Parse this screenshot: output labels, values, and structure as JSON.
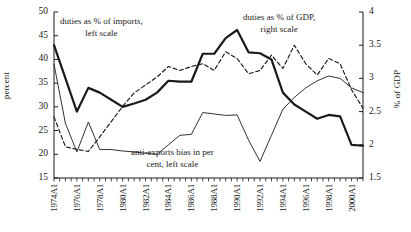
{
  "chart_data": {
    "type": "line",
    "title": "",
    "xlabel": "",
    "ylabel": "percent",
    "y2label": "% of GDP",
    "ylim": [
      15,
      50
    ],
    "y2lim": [
      1.5,
      4.0
    ],
    "grid": false,
    "legend": "inline-annotations",
    "x_tick_labels": [
      "1974A1",
      "1976A1",
      "1978A1",
      "1980A1",
      "1982A1",
      "1984A1",
      "1986A1",
      "1988A1",
      "1990A1",
      "1992A1",
      "1994A1",
      "1996A1",
      "1998A1",
      "2000A1"
    ],
    "y_tick_labels": [
      "15",
      "20",
      "25",
      "30",
      "35",
      "40",
      "45",
      "50"
    ],
    "y2_tick_labels": [
      "1.5",
      "2",
      "2.5",
      "3",
      "3.5",
      "4"
    ],
    "x": [
      1974,
      1975,
      1976,
      1977,
      1978,
      1979,
      1980,
      1981,
      1982,
      1983,
      1984,
      1985,
      1986,
      1987,
      1988,
      1989,
      1990,
      1991,
      1992,
      1993,
      1994,
      1995,
      1996,
      1997,
      1998,
      1999,
      2000,
      2001
    ],
    "series": [
      {
        "name": "duties as % of imports, left scale",
        "axis": "left",
        "style": "thick-solid",
        "color": "#1a1a1a",
        "values": [
          43.0,
          36.0,
          29.0,
          34.0,
          33.0,
          31.5,
          30.0,
          30.7,
          31.5,
          33.0,
          35.5,
          35.3,
          35.3,
          41.2,
          41.2,
          44.5,
          46.2,
          41.5,
          41.3,
          40.0,
          33.0,
          30.5,
          29.0,
          27.5,
          28.3,
          28.0,
          22.0,
          21.8
        ]
      },
      {
        "name": "duties as % of GDP, right scale",
        "axis": "right",
        "style": "dashed",
        "color": "#1a1a1a",
        "values": [
          2.42,
          1.97,
          1.93,
          1.9,
          2.12,
          2.35,
          2.58,
          2.78,
          2.9,
          3.02,
          3.18,
          3.12,
          3.18,
          3.22,
          3.12,
          3.4,
          3.3,
          3.07,
          3.12,
          3.35,
          3.15,
          3.5,
          3.22,
          3.05,
          3.3,
          3.22,
          2.83,
          2.55
        ]
      },
      {
        "name": "anti-exports bias in per cent, left scale",
        "axis": "left",
        "style": "thin-solid",
        "color": "#1a1a1a",
        "values": [
          39.0,
          26.5,
          20.5,
          26.8,
          21.0,
          21.0,
          20.7,
          20.5,
          20.2,
          20.0,
          22.0,
          24.0,
          24.2,
          28.8,
          28.5,
          28.2,
          28.3,
          23.0,
          18.5,
          24.0,
          29.5,
          32.0,
          34.0,
          35.5,
          36.5,
          36.0,
          34.0,
          33.0
        ]
      }
    ],
    "annotations": [
      {
        "id": "annot-imports",
        "line1": "duties as % of imports,",
        "line2": "left scale"
      },
      {
        "id": "annot-gdp",
        "line1": "duties as % of GDP,",
        "line2": "right scale"
      },
      {
        "id": "annot-bias",
        "line1": "anti-exports bias in per",
        "line2": "cent, left scale"
      }
    ]
  }
}
